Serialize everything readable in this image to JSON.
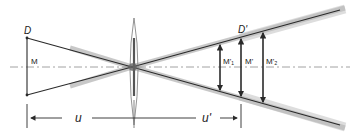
{
  "diagram": {
    "type": "thin-lens depth-of-field imaging",
    "labels": {
      "object_plane": "D",
      "image_plane": "D'",
      "object_size": "M",
      "image_size_near": "M'₁",
      "image_size": "M'",
      "image_size_far": "M'₂",
      "object_distance": "u",
      "image_distance": "u'"
    },
    "colors": {
      "line": "#2a2a2a",
      "ray_blur": "#9a9a9a",
      "axis": "#8a8a8a",
      "background": "#ffffff"
    }
  }
}
